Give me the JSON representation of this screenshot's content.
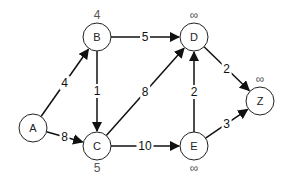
{
  "diagram": {
    "type": "weighted directed graph (shortest path)",
    "nodes": [
      {
        "id": "A",
        "label": "A",
        "x": 33,
        "y": 128,
        "distance": ""
      },
      {
        "id": "B",
        "label": "B",
        "x": 97,
        "y": 37,
        "distance": "4"
      },
      {
        "id": "C",
        "label": "C",
        "x": 97,
        "y": 146,
        "distance": "5"
      },
      {
        "id": "D",
        "label": "D",
        "x": 194,
        "y": 37,
        "distance": "∞"
      },
      {
        "id": "E",
        "label": "E",
        "x": 194,
        "y": 146,
        "distance": "∞"
      },
      {
        "id": "Z",
        "label": "Z",
        "x": 260,
        "y": 101,
        "distance": "∞"
      }
    ],
    "edges": [
      {
        "from": "A",
        "to": "B",
        "weight": "4"
      },
      {
        "from": "A",
        "to": "C",
        "weight": "8"
      },
      {
        "from": "B",
        "to": "C",
        "weight": "1"
      },
      {
        "from": "B",
        "to": "D",
        "weight": "5"
      },
      {
        "from": "C",
        "to": "D",
        "weight": "8"
      },
      {
        "from": "C",
        "to": "E",
        "weight": "10"
      },
      {
        "from": "E",
        "to": "D",
        "weight": "2"
      },
      {
        "from": "D",
        "to": "Z",
        "weight": "2"
      },
      {
        "from": "E",
        "to": "Z",
        "weight": "3"
      }
    ]
  }
}
